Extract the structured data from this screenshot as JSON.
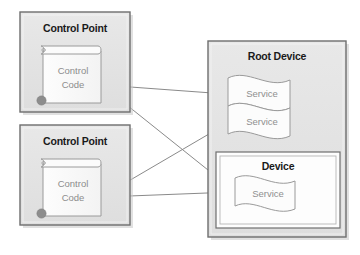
{
  "diagram": {
    "background_color": "#ffffff",
    "box_fill": "#e3e3e3",
    "box_border": "#6b6b6b",
    "inner_fill": "#ffffff",
    "label_color": "#1a1a1a",
    "muted_text_color": "#8f8f8f",
    "line_color": "#8a8a8a",
    "control_points": [
      {
        "label": "Control Point",
        "code_label_line1": "Control",
        "code_label_line2": "Code"
      },
      {
        "label": "Control Point",
        "code_label_line1": "Control",
        "code_label_line2": "Code"
      }
    ],
    "root_device": {
      "label": "Root Device",
      "services": [
        {
          "label": "Service"
        },
        {
          "label": "Service"
        }
      ],
      "nested_device": {
        "label": "Device",
        "services": [
          {
            "label": "Service"
          }
        ]
      }
    },
    "connections": [
      {
        "from": "control-point-1-code",
        "to": "root-device-service-1"
      },
      {
        "from": "control-point-1-code",
        "to": "nested-device-service-1"
      },
      {
        "from": "control-point-2-code",
        "to": "root-device-service-2"
      },
      {
        "from": "control-point-2-code",
        "to": "nested-device-service-1"
      }
    ]
  }
}
